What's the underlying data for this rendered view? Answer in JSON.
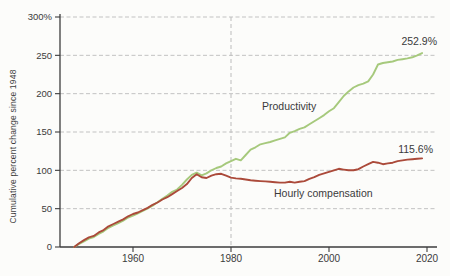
{
  "chart_data": {
    "type": "line",
    "title": "",
    "ylabel": "Cumulative percent change since 1948",
    "xlabel": "",
    "xlim": [
      1946,
      2022
    ],
    "ylim": [
      0,
      300
    ],
    "grid": "dashed-horizontal",
    "reference_line_year": 1980,
    "x_ticks": [
      {
        "v": 1960,
        "label": "1960"
      },
      {
        "v": 1980,
        "label": "1980"
      },
      {
        "v": 2000,
        "label": "2000"
      },
      {
        "v": 2020,
        "label": "2020"
      }
    ],
    "y_ticks": [
      {
        "v": 0,
        "label": "0"
      },
      {
        "v": 50,
        "label": "50"
      },
      {
        "v": 100,
        "label": "100"
      },
      {
        "v": 150,
        "label": "150"
      },
      {
        "v": 200,
        "label": "200"
      },
      {
        "v": 250,
        "label": "250"
      },
      {
        "v": 300,
        "label": "300%"
      }
    ],
    "y_gridlines": [
      50,
      100,
      150,
      200,
      250,
      300
    ],
    "colors": {
      "productivity": "#a6c97c",
      "compensation": "#ab4a3a",
      "grid": "#c2c2c2",
      "axis": "#3d3d3d",
      "text": "#3b3b3b"
    },
    "series": [
      {
        "name": "productivity",
        "label": "Productivity",
        "end_label": "252.9%",
        "color_key": "productivity",
        "points": [
          [
            1948,
            0
          ],
          [
            1949,
            4
          ],
          [
            1950,
            7.5
          ],
          [
            1951,
            11
          ],
          [
            1952,
            13
          ],
          [
            1953,
            17
          ],
          [
            1954,
            20.5
          ],
          [
            1955,
            25
          ],
          [
            1956,
            28
          ],
          [
            1957,
            31
          ],
          [
            1958,
            34.5
          ],
          [
            1959,
            38.5
          ],
          [
            1960,
            41
          ],
          [
            1961,
            44
          ],
          [
            1962,
            47
          ],
          [
            1963,
            50.5
          ],
          [
            1964,
            54
          ],
          [
            1965,
            58.5
          ],
          [
            1966,
            63
          ],
          [
            1967,
            67
          ],
          [
            1968,
            72
          ],
          [
            1969,
            75
          ],
          [
            1970,
            81
          ],
          [
            1971,
            88
          ],
          [
            1972,
            94
          ],
          [
            1973,
            97
          ],
          [
            1974,
            93.5
          ],
          [
            1975,
            96
          ],
          [
            1976,
            100
          ],
          [
            1977,
            103
          ],
          [
            1978,
            105
          ],
          [
            1979,
            109
          ],
          [
            1980,
            112
          ],
          [
            1981,
            115
          ],
          [
            1982,
            113
          ],
          [
            1983,
            120
          ],
          [
            1984,
            127
          ],
          [
            1985,
            130
          ],
          [
            1986,
            134
          ],
          [
            1987,
            135.5
          ],
          [
            1988,
            137
          ],
          [
            1989,
            139
          ],
          [
            1990,
            141
          ],
          [
            1991,
            143
          ],
          [
            1992,
            149
          ],
          [
            1993,
            151
          ],
          [
            1994,
            154
          ],
          [
            1995,
            156
          ],
          [
            1996,
            160
          ],
          [
            1997,
            164
          ],
          [
            1998,
            168
          ],
          [
            1999,
            172
          ],
          [
            2000,
            177
          ],
          [
            2001,
            181
          ],
          [
            2002,
            189
          ],
          [
            2003,
            197
          ],
          [
            2004,
            203
          ],
          [
            2005,
            208
          ],
          [
            2006,
            211
          ],
          [
            2007,
            213
          ],
          [
            2008,
            216
          ],
          [
            2009,
            225
          ],
          [
            2010,
            238
          ],
          [
            2011,
            240
          ],
          [
            2012,
            241
          ],
          [
            2013,
            242
          ],
          [
            2014,
            244
          ],
          [
            2015,
            245
          ],
          [
            2016,
            246
          ],
          [
            2017,
            247.5
          ],
          [
            2018,
            250
          ],
          [
            2019,
            252.9
          ]
        ]
      },
      {
        "name": "hourly-compensation",
        "label": "Hourly compensation",
        "end_label": "115.6%",
        "color_key": "compensation",
        "points": [
          [
            1948,
            0
          ],
          [
            1949,
            5
          ],
          [
            1950,
            9
          ],
          [
            1951,
            12.5
          ],
          [
            1952,
            14.5
          ],
          [
            1953,
            19
          ],
          [
            1954,
            22
          ],
          [
            1955,
            27
          ],
          [
            1956,
            30
          ],
          [
            1957,
            33
          ],
          [
            1958,
            36
          ],
          [
            1959,
            40
          ],
          [
            1960,
            43
          ],
          [
            1961,
            45
          ],
          [
            1962,
            48
          ],
          [
            1963,
            51
          ],
          [
            1964,
            55
          ],
          [
            1965,
            58
          ],
          [
            1966,
            62
          ],
          [
            1967,
            65
          ],
          [
            1968,
            69
          ],
          [
            1969,
            73
          ],
          [
            1970,
            77
          ],
          [
            1971,
            82
          ],
          [
            1972,
            90
          ],
          [
            1973,
            95
          ],
          [
            1974,
            91
          ],
          [
            1975,
            90
          ],
          [
            1976,
            93
          ],
          [
            1977,
            95
          ],
          [
            1978,
            95.5
          ],
          [
            1979,
            93
          ],
          [
            1980,
            90.5
          ],
          [
            1981,
            89.5
          ],
          [
            1982,
            89
          ],
          [
            1983,
            88
          ],
          [
            1984,
            87
          ],
          [
            1985,
            86.5
          ],
          [
            1986,
            86
          ],
          [
            1987,
            85.5
          ],
          [
            1988,
            85
          ],
          [
            1989,
            84.5
          ],
          [
            1990,
            84
          ],
          [
            1991,
            84
          ],
          [
            1992,
            85
          ],
          [
            1993,
            84
          ],
          [
            1994,
            85
          ],
          [
            1995,
            86
          ],
          [
            1996,
            89
          ],
          [
            1997,
            91
          ],
          [
            1998,
            94
          ],
          [
            1999,
            96
          ],
          [
            2000,
            98
          ],
          [
            2001,
            100
          ],
          [
            2002,
            102
          ],
          [
            2003,
            101
          ],
          [
            2004,
            100
          ],
          [
            2005,
            100
          ],
          [
            2006,
            101.5
          ],
          [
            2007,
            105
          ],
          [
            2008,
            108
          ],
          [
            2009,
            111
          ],
          [
            2010,
            110
          ],
          [
            2011,
            108
          ],
          [
            2012,
            109
          ],
          [
            2013,
            110
          ],
          [
            2014,
            112
          ],
          [
            2015,
            113
          ],
          [
            2016,
            114
          ],
          [
            2017,
            114.5
          ],
          [
            2018,
            115
          ],
          [
            2019,
            115.6
          ]
        ]
      }
    ]
  }
}
